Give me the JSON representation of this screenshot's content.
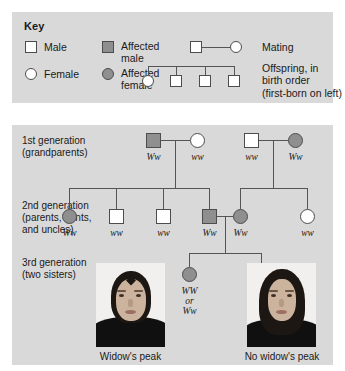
{
  "key": {
    "title": "Key",
    "entries": [
      {
        "label": "Male",
        "symbol": "square-unaffected"
      },
      {
        "label": "Female",
        "symbol": "circle-unaffected"
      },
      {
        "label": "Affected\nmale",
        "symbol": "square-affected"
      },
      {
        "label": "Affected\nfemale",
        "symbol": "circle-affected"
      }
    ],
    "mating_label": "Mating",
    "offspring_label": "Offspring, in\nbirth order\n(first-born on left)"
  },
  "generations": [
    {
      "label": "1st generation\n(grandparents)"
    },
    {
      "label": "2nd generation\n(parents, aunts,\nand uncles)"
    },
    {
      "label": "3rd generation\n(two sisters)"
    }
  ],
  "pedigree": {
    "generation1": [
      {
        "sex": "male",
        "affected": true,
        "genotype": "Ww"
      },
      {
        "sex": "female",
        "affected": false,
        "genotype": "ww"
      },
      {
        "sex": "male",
        "affected": false,
        "genotype": "ww"
      },
      {
        "sex": "female",
        "affected": true,
        "genotype": "Ww"
      }
    ],
    "generation2": [
      {
        "sex": "female",
        "affected": true,
        "genotype": "Ww"
      },
      {
        "sex": "male",
        "affected": false,
        "genotype": "ww"
      },
      {
        "sex": "male",
        "affected": false,
        "genotype": "ww"
      },
      {
        "sex": "male",
        "affected": true,
        "genotype": "Ww"
      },
      {
        "sex": "female",
        "affected": true,
        "genotype": "Ww"
      },
      {
        "sex": "female",
        "affected": false,
        "genotype": "ww"
      }
    ],
    "generation3": [
      {
        "sex": "female",
        "affected": true,
        "genotype": "WW\nor\nWw"
      },
      {
        "sex": "female",
        "affected": false,
        "genotype": "ww"
      }
    ]
  },
  "photos": [
    {
      "caption": "Widow's peak",
      "has_peak": true
    },
    {
      "caption": "No widow's peak",
      "has_peak": false
    }
  ],
  "colors": {
    "panel_bg": "#d9d9d9",
    "affected_fill": "#8f8f8f",
    "unaffected_fill": "#ffffff",
    "symbol_stroke": "#4d4d4d",
    "line": "#555555",
    "text": "#1a1a1a"
  }
}
